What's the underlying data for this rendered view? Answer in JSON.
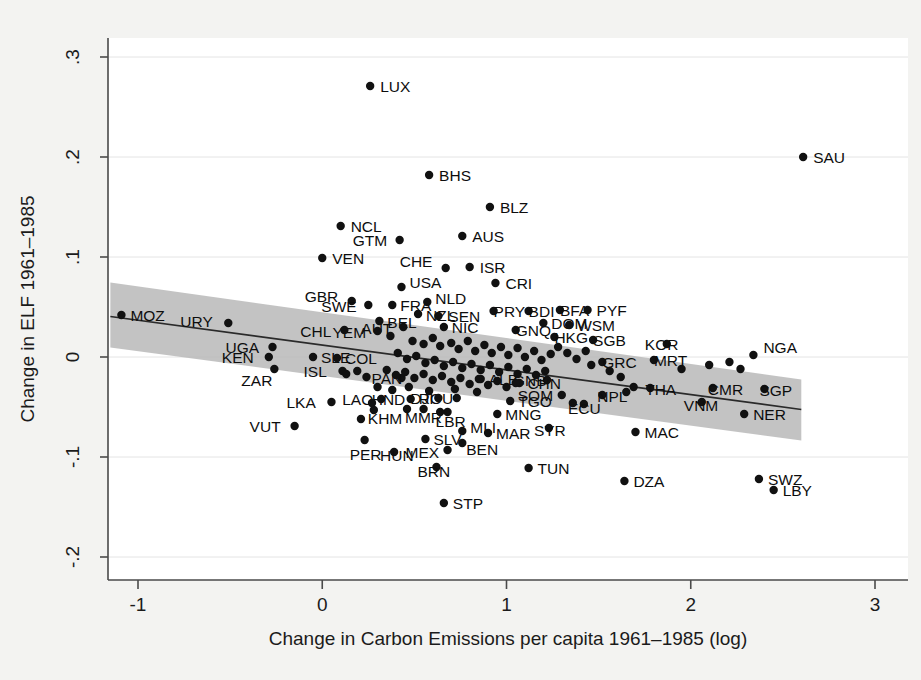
{
  "chart_data": {
    "type": "scatter",
    "title": "",
    "xlabel": "Change in Carbon Emissions per capita 1961–1985 (log)",
    "ylabel": "Change in ELF 1961–1985",
    "xlim": [
      -1.16,
      3.1
    ],
    "ylim": [
      -0.22,
      0.31
    ],
    "xticks": [
      -1,
      0,
      1,
      2,
      3
    ],
    "xtick_labels": [
      "-1",
      "0",
      "1",
      "2",
      "3"
    ],
    "yticks": [
      0.3,
      0.2,
      0.1,
      0,
      -0.1,
      -0.2
    ],
    "ytick_labels": [
      ".3",
      ".2",
      ".1",
      "0",
      "-.1",
      "-.2"
    ],
    "grid": true,
    "legend": "none",
    "marker_color": "#111111",
    "fit_line_color": "#2a2a2a",
    "ci_band_color": "#b9b9b9",
    "fit_line": {
      "x_start": -1.15,
      "y_start": 0.0405,
      "x_end": 2.6,
      "y_end": -0.0525
    },
    "ci_band": {
      "x_start": -1.15,
      "x_end": 2.6,
      "upper_start": 0.0745,
      "lower_start": 0.0095,
      "upper_end": -0.0225,
      "lower_end": -0.0835
    },
    "points": [
      {
        "label": "LUX",
        "x": 0.26,
        "y": 0.271,
        "lx": 10,
        "ly": 6
      },
      {
        "label": "SAU",
        "x": 2.61,
        "y": 0.2,
        "lx": 10,
        "ly": 6
      },
      {
        "label": "BHS",
        "x": 0.58,
        "y": 0.182,
        "lx": 10,
        "ly": 6
      },
      {
        "label": "BLZ",
        "x": 0.91,
        "y": 0.15,
        "lx": 10,
        "ly": 6
      },
      {
        "label": "NCL",
        "x": 0.1,
        "y": 0.131,
        "lx": 10,
        "ly": 6
      },
      {
        "label": "AUS",
        "x": 0.76,
        "y": 0.121,
        "lx": 10,
        "ly": 6
      },
      {
        "label": "GTM",
        "x": 0.42,
        "y": 0.117,
        "lx": -47,
        "ly": 6
      },
      {
        "label": "VEN",
        "x": 0.0,
        "y": 0.099,
        "lx": 10,
        "ly": 6
      },
      {
        "label": "CHE",
        "x": 0.67,
        "y": 0.089,
        "lx": -46,
        "ly": -1
      },
      {
        "label": "ISR",
        "x": 0.8,
        "y": 0.09,
        "lx": 10,
        "ly": 6
      },
      {
        "label": "CRI",
        "x": 0.94,
        "y": 0.074,
        "lx": 10,
        "ly": 6
      },
      {
        "label": "USA",
        "x": 0.43,
        "y": 0.07,
        "lx": 8,
        "ly": 1
      },
      {
        "label": "GBR",
        "x": 0.16,
        "y": 0.056,
        "lx": -47,
        "ly": 1
      },
      {
        "label": "SWE",
        "x": 0.25,
        "y": 0.052,
        "lx": -47,
        "ly": 7
      },
      {
        "label": "FRA",
        "x": 0.38,
        "y": 0.052,
        "lx": 8,
        "ly": 6
      },
      {
        "label": "NLD",
        "x": 0.57,
        "y": 0.055,
        "lx": 8,
        "ly": 2
      },
      {
        "label": "NZL",
        "x": 0.52,
        "y": 0.043,
        "lx": 8,
        "ly": 7
      },
      {
        "label": "SEN",
        "x": 0.63,
        "y": 0.041,
        "lx": 10,
        "ly": 6
      },
      {
        "label": "PRY",
        "x": 0.93,
        "y": 0.046,
        "lx": 0,
        "ly": 6
      },
      {
        "label": "BDI",
        "x": 1.12,
        "y": 0.046,
        "lx": 0,
        "ly": 6
      },
      {
        "label": "BFA",
        "x": 1.29,
        "y": 0.047,
        "lx": 0,
        "ly": 6
      },
      {
        "label": "PYF",
        "x": 1.44,
        "y": 0.047,
        "lx": 9,
        "ly": 6
      },
      {
        "label": "BEL",
        "x": 0.31,
        "y": 0.036,
        "lx": 8,
        "ly": 7
      },
      {
        "label": "AUT",
        "x": 0.44,
        "y": 0.03,
        "lx": -42,
        "ly": 7
      },
      {
        "label": "YEM",
        "x": 0.3,
        "y": 0.026,
        "lx": -45,
        "ly": 7
      },
      {
        "label": "CHL",
        "x": 0.12,
        "y": 0.027,
        "lx": -44,
        "ly": 7
      },
      {
        "label": "URY",
        "x": -0.51,
        "y": 0.034,
        "lx": -48,
        "ly": 4
      },
      {
        "label": "MOZ",
        "x": -1.09,
        "y": 0.042,
        "lx": 9,
        "ly": 6
      },
      {
        "label": "NIC",
        "x": 0.66,
        "y": 0.03,
        "lx": 8,
        "ly": 6
      },
      {
        "label": "DOM",
        "x": 1.2,
        "y": 0.034,
        "lx": 8,
        "ly": 6
      },
      {
        "label": "WSM",
        "x": 1.34,
        "y": 0.032,
        "lx": 8,
        "ly": 6
      },
      {
        "label": "GNQ",
        "x": 1.05,
        "y": 0.027,
        "lx": 0,
        "ly": 6
      },
      {
        "label": "HKG",
        "x": 1.26,
        "y": 0.02,
        "lx": 0,
        "ly": 6
      },
      {
        "label": "SGB",
        "x": 1.47,
        "y": 0.017,
        "lx": 0,
        "ly": 6
      },
      {
        "label": "KOR",
        "x": 1.87,
        "y": 0.013,
        "lx": -22,
        "ly": 6
      },
      {
        "label": "NGA",
        "x": 2.34,
        "y": 0.002,
        "lx": 10,
        "ly": -2
      },
      {
        "label": "MRT",
        "x": 1.8,
        "y": -0.003,
        "lx": 0,
        "ly": 6
      },
      {
        "label": "GRC",
        "x": 1.52,
        "y": -0.005,
        "lx": 0,
        "ly": 6
      },
      {
        "label": "UGA",
        "x": -0.27,
        "y": 0.01,
        "lx": -47,
        "ly": 6
      },
      {
        "label": "KEN",
        "x": -0.29,
        "y": 0.0,
        "lx": -47,
        "ly": 6
      },
      {
        "label": "ZAR",
        "x": -0.26,
        "y": -0.012,
        "lx": -33,
        "ly": 17
      },
      {
        "label": "SLE",
        "x": -0.05,
        "y": 0.0,
        "lx": 8,
        "ly": 6
      },
      {
        "label": "COL",
        "x": 0.08,
        "y": -0.001,
        "lx": 8,
        "ly": 6
      },
      {
        "label": "ISL",
        "x": 0.11,
        "y": -0.014,
        "lx": -39,
        "ly": 6
      },
      {
        "label": "ALB",
        "x": 0.86,
        "y": -0.022,
        "lx": 8,
        "ly": 6
      },
      {
        "label": "PAN",
        "x": 0.43,
        "y": -0.021,
        "lx": -30,
        "ly": 6
      },
      {
        "label": "GNB",
        "x": 1.22,
        "y": -0.023,
        "lx": -34,
        "ly": 6
      },
      {
        "label": "CHN",
        "x": 1.07,
        "y": -0.026,
        "lx": 8,
        "ly": 6
      },
      {
        "label": "THA",
        "x": 1.78,
        "y": -0.031,
        "lx": -5,
        "ly": 7
      },
      {
        "label": "CMR",
        "x": 2.12,
        "y": -0.031,
        "lx": -5,
        "ly": 7
      },
      {
        "label": "SGP",
        "x": 2.4,
        "y": -0.032,
        "lx": -5,
        "ly": 7
      },
      {
        "label": "NPL",
        "x": 1.52,
        "y": -0.038,
        "lx": -5,
        "ly": 7
      },
      {
        "label": "SOM",
        "x": 1.3,
        "y": -0.038,
        "lx": -44,
        "ly": 6
      },
      {
        "label": "TGO",
        "x": 1.02,
        "y": -0.044,
        "lx": 8,
        "ly": 6
      },
      {
        "label": "VNM",
        "x": 2.06,
        "y": -0.045,
        "lx": -18,
        "ly": 9
      },
      {
        "label": "ECU",
        "x": 1.42,
        "y": -0.047,
        "lx": -16,
        "ly": 10
      },
      {
        "label": "ROU",
        "x": 0.73,
        "y": -0.041,
        "lx": -38,
        "ly": 6
      },
      {
        "label": "DJI",
        "x": 0.63,
        "y": -0.041,
        "lx": -28,
        "ly": 6
      },
      {
        "label": "HND",
        "x": 0.48,
        "y": -0.042,
        "lx": -39,
        "ly": 6
      },
      {
        "label": "LAO",
        "x": 0.32,
        "y": -0.042,
        "lx": -39,
        "ly": 6
      },
      {
        "label": "LKA",
        "x": 0.05,
        "y": -0.045,
        "lx": -45,
        "ly": 6
      },
      {
        "label": "KHM",
        "x": 0.28,
        "y": -0.053,
        "lx": -6,
        "ly": 14
      },
      {
        "label": "MMR",
        "x": 0.46,
        "y": -0.052,
        "lx": -2,
        "ly": 14
      },
      {
        "label": "LBR",
        "x": 0.68,
        "y": -0.055,
        "lx": -12,
        "ly": 15
      },
      {
        "label": "MNG",
        "x": 0.95,
        "y": -0.057,
        "lx": 8,
        "ly": 6
      },
      {
        "label": "NER",
        "x": 2.29,
        "y": -0.057,
        "lx": 9,
        "ly": 6
      },
      {
        "label": "VUT",
        "x": -0.15,
        "y": -0.069,
        "lx": -45,
        "ly": 6
      },
      {
        "label": "MAC",
        "x": 1.7,
        "y": -0.075,
        "lx": 9,
        "ly": 6
      },
      {
        "label": "SYR",
        "x": 1.23,
        "y": -0.071,
        "lx": -15,
        "ly": 8
      },
      {
        "label": "MLI",
        "x": 0.76,
        "y": -0.074,
        "lx": 8,
        "ly": 2
      },
      {
        "label": "MAR",
        "x": 0.9,
        "y": -0.076,
        "lx": 8,
        "ly": 6
      },
      {
        "label": "SLV",
        "x": 0.56,
        "y": -0.082,
        "lx": 8,
        "ly": 6
      },
      {
        "label": "BEN",
        "x": 0.76,
        "y": -0.086,
        "lx": 4,
        "ly": 12
      },
      {
        "label": "MEX",
        "x": 0.68,
        "y": -0.093,
        "lx": -42,
        "ly": 8
      },
      {
        "label": "HUN",
        "x": 0.39,
        "y": -0.095,
        "lx": -14,
        "ly": 9
      },
      {
        "label": "PER",
        "x": 0.23,
        "y": -0.083,
        "lx": -15,
        "ly": 20
      },
      {
        "label": "TUN",
        "x": 1.12,
        "y": -0.111,
        "lx": 9,
        "ly": 6
      },
      {
        "label": "BRN",
        "x": 0.62,
        "y": -0.11,
        "lx": -19,
        "ly": 10
      },
      {
        "label": "DZA",
        "x": 1.64,
        "y": -0.124,
        "lx": 9,
        "ly": 6
      },
      {
        "label": "SWZ",
        "x": 2.37,
        "y": -0.122,
        "lx": 9,
        "ly": 6
      },
      {
        "label": "LBY",
        "x": 2.45,
        "y": -0.133,
        "lx": 9,
        "ly": 6
      },
      {
        "label": "STP",
        "x": 0.66,
        "y": -0.146,
        "lx": 9,
        "ly": 6
      },
      {
        "label": "",
        "x": 0.37,
        "y": 0.021,
        "lx": 0,
        "ly": 0
      },
      {
        "label": "",
        "x": 0.49,
        "y": 0.016,
        "lx": 0,
        "ly": 0
      },
      {
        "label": "",
        "x": 0.55,
        "y": 0.013,
        "lx": 0,
        "ly": 0
      },
      {
        "label": "",
        "x": 0.6,
        "y": 0.019,
        "lx": 0,
        "ly": 0
      },
      {
        "label": "",
        "x": 0.64,
        "y": 0.011,
        "lx": 0,
        "ly": 0
      },
      {
        "label": "",
        "x": 0.7,
        "y": 0.014,
        "lx": 0,
        "ly": 0
      },
      {
        "label": "",
        "x": 0.74,
        "y": 0.008,
        "lx": 0,
        "ly": 0
      },
      {
        "label": "",
        "x": 0.79,
        "y": 0.016,
        "lx": 0,
        "ly": 0
      },
      {
        "label": "",
        "x": 0.83,
        "y": 0.006,
        "lx": 0,
        "ly": 0
      },
      {
        "label": "",
        "x": 0.88,
        "y": 0.012,
        "lx": 0,
        "ly": 0
      },
      {
        "label": "",
        "x": 0.92,
        "y": 0.004,
        "lx": 0,
        "ly": 0
      },
      {
        "label": "",
        "x": 0.97,
        "y": 0.01,
        "lx": 0,
        "ly": 0
      },
      {
        "label": "",
        "x": 1.01,
        "y": 0.002,
        "lx": 0,
        "ly": 0
      },
      {
        "label": "",
        "x": 1.06,
        "y": 0.009,
        "lx": 0,
        "ly": 0
      },
      {
        "label": "",
        "x": 1.1,
        "y": 0.0,
        "lx": 0,
        "ly": 0
      },
      {
        "label": "",
        "x": 1.15,
        "y": 0.006,
        "lx": 0,
        "ly": 0
      },
      {
        "label": "",
        "x": 1.19,
        "y": -0.003,
        "lx": 0,
        "ly": 0
      },
      {
        "label": "",
        "x": 1.24,
        "y": 0.003,
        "lx": 0,
        "ly": 0
      },
      {
        "label": "",
        "x": 0.41,
        "y": 0.004,
        "lx": 0,
        "ly": 0
      },
      {
        "label": "",
        "x": 0.46,
        "y": -0.002,
        "lx": 0,
        "ly": 0
      },
      {
        "label": "",
        "x": 0.51,
        "y": 0.001,
        "lx": 0,
        "ly": 0
      },
      {
        "label": "",
        "x": 0.56,
        "y": -0.006,
        "lx": 0,
        "ly": 0
      },
      {
        "label": "",
        "x": 0.61,
        "y": -0.003,
        "lx": 0,
        "ly": 0
      },
      {
        "label": "",
        "x": 0.66,
        "y": -0.009,
        "lx": 0,
        "ly": 0
      },
      {
        "label": "",
        "x": 0.71,
        "y": -0.005,
        "lx": 0,
        "ly": 0
      },
      {
        "label": "",
        "x": 0.76,
        "y": -0.011,
        "lx": 0,
        "ly": 0
      },
      {
        "label": "",
        "x": 0.81,
        "y": -0.007,
        "lx": 0,
        "ly": 0
      },
      {
        "label": "",
        "x": 0.86,
        "y": -0.013,
        "lx": 0,
        "ly": 0
      },
      {
        "label": "",
        "x": 0.91,
        "y": -0.008,
        "lx": 0,
        "ly": 0
      },
      {
        "label": "",
        "x": 0.96,
        "y": -0.015,
        "lx": 0,
        "ly": 0
      },
      {
        "label": "",
        "x": 1.01,
        "y": -0.01,
        "lx": 0,
        "ly": 0
      },
      {
        "label": "",
        "x": 1.06,
        "y": -0.017,
        "lx": 0,
        "ly": 0
      },
      {
        "label": "",
        "x": 1.11,
        "y": -0.012,
        "lx": 0,
        "ly": 0
      },
      {
        "label": "",
        "x": 1.16,
        "y": -0.018,
        "lx": 0,
        "ly": 0
      },
      {
        "label": "",
        "x": 1.21,
        "y": -0.014,
        "lx": 0,
        "ly": 0
      },
      {
        "label": "",
        "x": 0.35,
        "y": -0.013,
        "lx": 0,
        "ly": 0
      },
      {
        "label": "",
        "x": 0.4,
        "y": -0.018,
        "lx": 0,
        "ly": 0
      },
      {
        "label": "",
        "x": 0.45,
        "y": -0.015,
        "lx": 0,
        "ly": 0
      },
      {
        "label": "",
        "x": 0.5,
        "y": -0.021,
        "lx": 0,
        "ly": 0
      },
      {
        "label": "",
        "x": 0.55,
        "y": -0.017,
        "lx": 0,
        "ly": 0
      },
      {
        "label": "",
        "x": 0.6,
        "y": -0.023,
        "lx": 0,
        "ly": 0
      },
      {
        "label": "",
        "x": 0.65,
        "y": -0.019,
        "lx": 0,
        "ly": 0
      },
      {
        "label": "",
        "x": 0.7,
        "y": -0.025,
        "lx": 0,
        "ly": 0
      },
      {
        "label": "",
        "x": 0.75,
        "y": -0.021,
        "lx": 0,
        "ly": 0
      },
      {
        "label": "",
        "x": 0.8,
        "y": -0.027,
        "lx": 0,
        "ly": 0
      },
      {
        "label": "",
        "x": 0.85,
        "y": -0.022,
        "lx": 0,
        "ly": 0
      },
      {
        "label": "",
        "x": 0.9,
        "y": -0.028,
        "lx": 0,
        "ly": 0
      },
      {
        "label": "",
        "x": 0.95,
        "y": -0.024,
        "lx": 0,
        "ly": 0
      },
      {
        "label": "",
        "x": 1.0,
        "y": -0.03,
        "lx": 0,
        "ly": 0
      },
      {
        "label": "",
        "x": 1.05,
        "y": -0.026,
        "lx": 0,
        "ly": 0
      },
      {
        "label": "",
        "x": 1.28,
        "y": 0.01,
        "lx": 0,
        "ly": 0
      },
      {
        "label": "",
        "x": 1.33,
        "y": 0.004,
        "lx": 0,
        "ly": 0
      },
      {
        "label": "",
        "x": 1.38,
        "y": -0.002,
        "lx": 0,
        "ly": 0
      },
      {
        "label": "",
        "x": 1.43,
        "y": 0.006,
        "lx": 0,
        "ly": 0
      },
      {
        "label": "",
        "x": 1.46,
        "y": -0.008,
        "lx": 0,
        "ly": 0
      },
      {
        "label": "",
        "x": 1.56,
        "y": -0.014,
        "lx": 0,
        "ly": 0
      },
      {
        "label": "",
        "x": 1.62,
        "y": -0.02,
        "lx": 0,
        "ly": 0
      },
      {
        "label": "",
        "x": 1.95,
        "y": -0.012,
        "lx": 0,
        "ly": 0
      },
      {
        "label": "",
        "x": 2.1,
        "y": -0.008,
        "lx": 0,
        "ly": 0
      },
      {
        "label": "",
        "x": 2.21,
        "y": -0.005,
        "lx": 0,
        "ly": 0
      },
      {
        "label": "",
        "x": 2.27,
        "y": -0.012,
        "lx": 0,
        "ly": 0
      },
      {
        "label": "",
        "x": 0.3,
        "y": -0.03,
        "lx": 0,
        "ly": 0
      },
      {
        "label": "",
        "x": 0.38,
        "y": -0.033,
        "lx": 0,
        "ly": 0
      },
      {
        "label": "",
        "x": 0.47,
        "y": -0.03,
        "lx": 0,
        "ly": 0
      },
      {
        "label": "",
        "x": 0.58,
        "y": -0.034,
        "lx": 0,
        "ly": 0
      },
      {
        "label": "",
        "x": 0.72,
        "y": -0.032,
        "lx": 0,
        "ly": 0
      },
      {
        "label": "",
        "x": 0.84,
        "y": -0.035,
        "lx": 0,
        "ly": 0
      },
      {
        "label": "",
        "x": 0.13,
        "y": -0.017,
        "lx": 0,
        "ly": 0
      },
      {
        "label": "",
        "x": 0.19,
        "y": -0.014,
        "lx": 0,
        "ly": 0
      },
      {
        "label": "",
        "x": 0.24,
        "y": -0.02,
        "lx": 0,
        "ly": 0
      },
      {
        "label": "",
        "x": 0.27,
        "y": -0.046,
        "lx": 0,
        "ly": 0
      },
      {
        "label": "",
        "x": 0.21,
        "y": -0.062,
        "lx": 0,
        "ly": 0
      },
      {
        "label": "",
        "x": 0.55,
        "y": -0.052,
        "lx": 0,
        "ly": 0
      },
      {
        "label": "",
        "x": 0.64,
        "y": -0.055,
        "lx": 0,
        "ly": 0
      },
      {
        "label": "",
        "x": 1.65,
        "y": -0.035,
        "lx": 0,
        "ly": 0
      },
      {
        "label": "",
        "x": 1.36,
        "y": -0.046,
        "lx": 0,
        "ly": 0
      },
      {
        "label": "",
        "x": 1.69,
        "y": -0.03,
        "lx": 0,
        "ly": 0
      }
    ]
  }
}
